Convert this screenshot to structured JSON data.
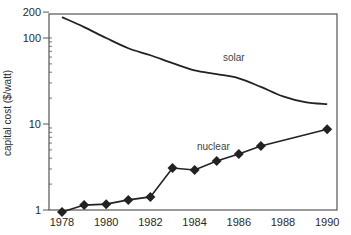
{
  "chart_data": {
    "type": "line",
    "title": "",
    "xlabel": "",
    "ylabel": "capital cost ($/watt)",
    "yscale": "log",
    "ylim": [
      1,
      200
    ],
    "xlim": [
      1978,
      1990
    ],
    "grid": false,
    "legend_position": "inline labels",
    "x_ticks": [
      "1978",
      "1980",
      "1982",
      "1984",
      "1986",
      "1988",
      "1990"
    ],
    "y_ticks": [
      "1",
      "10",
      "100",
      "200"
    ],
    "x": [
      1978,
      1979,
      1980,
      1981,
      1982,
      1983,
      1984,
      1985,
      1986,
      1987,
      1988,
      1989,
      1990
    ],
    "series": [
      {
        "name": "solar",
        "label": "solar",
        "marker": "none",
        "x": [
          1978,
          1979,
          1980,
          1981,
          1982,
          1983,
          1984,
          1985,
          1986,
          1987,
          1988,
          1989,
          1990
        ],
        "values": [
          175,
          134,
          100,
          76,
          63,
          51,
          42,
          38,
          34,
          27,
          21,
          18,
          17
        ]
      },
      {
        "name": "nuclear",
        "label": "nuclear",
        "marker": "diamond",
        "x": [
          1978,
          1979,
          1980,
          1981,
          1982,
          1983,
          1984,
          1985,
          1986,
          1987,
          1990
        ],
        "values": [
          0.95,
          1.14,
          1.17,
          1.31,
          1.42,
          3.08,
          2.92,
          3.71,
          4.49,
          5.54,
          8.7
        ]
      }
    ]
  },
  "colors": {
    "line": "#222222",
    "frame": "#555555",
    "text": "#2a2a2a"
  }
}
